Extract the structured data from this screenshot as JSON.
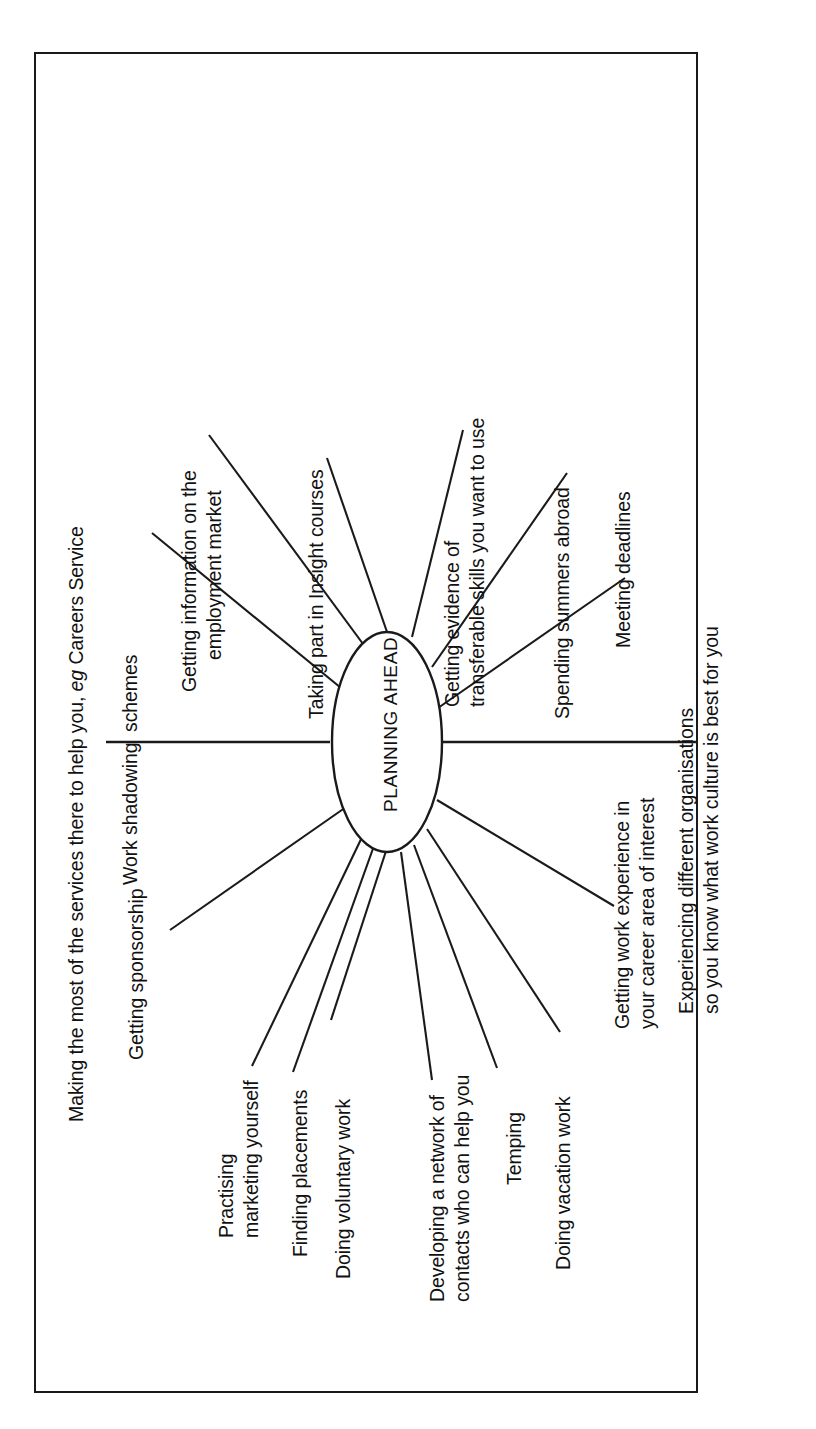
{
  "diagram": {
    "title": "PLANNING AHEAD",
    "orientation": "rotated-90-ccw",
    "center_node": {
      "label": "PLANNING AHEAD",
      "shape": "ellipse"
    },
    "frame": {
      "border_color": "#1a1a1a"
    },
    "branches": [
      {
        "id": "careers-service",
        "label_lines": [
          "Making the most of the services there to help you, ",
          "eg",
          " Careers Service"
        ],
        "label_plain": "Making the most of the services there to help you, eg Careers Service",
        "has_italic_eg": true,
        "connector": "horizontal-line-left"
      },
      {
        "id": "work-shadowing",
        "label_lines": [
          "Work shadowing  schemes"
        ],
        "label_plain": "Work shadowing  schemes",
        "connector": "diagonal-spoke"
      },
      {
        "id": "employment-market",
        "label_lines": [
          "Getting information on the",
          "employment market"
        ],
        "label_plain": "Getting information on the employment market",
        "connector": "diagonal-spoke"
      },
      {
        "id": "insight-courses",
        "label_lines": [
          "Taking part in Insight courses"
        ],
        "label_plain": "Taking part in Insight courses",
        "connector": "diagonal-spoke"
      },
      {
        "id": "transferable-skills",
        "label_lines": [
          "Getting evidence of",
          "transferable skills you want to use"
        ],
        "label_plain": "Getting evidence of transferable skills you want to use",
        "connector": "diagonal-spoke"
      },
      {
        "id": "summers-abroad",
        "label_lines": [
          "Spending summers abroad"
        ],
        "label_plain": "Spending summers abroad",
        "connector": "diagonal-spoke"
      },
      {
        "id": "meeting-deadlines",
        "label_lines": [
          "Meeting deadlines"
        ],
        "label_plain": "Meeting deadlines",
        "connector": "diagonal-spoke"
      },
      {
        "id": "different-organisations",
        "label_lines": [
          "Experiencing different organisations",
          "so you know what work culture is best for you"
        ],
        "label_plain": "Experiencing different organisations so you know what work culture is best for you",
        "connector": "horizontal-line-right"
      },
      {
        "id": "work-experience",
        "label_lines": [
          "Getting work experience in",
          "your career area of interest"
        ],
        "label_plain": "Getting work experience in your career area of interest",
        "connector": "diagonal-spoke"
      },
      {
        "id": "vacation-work",
        "label_lines": [
          "Doing vacation work"
        ],
        "label_plain": "Doing vacation work",
        "connector": "diagonal-spoke"
      },
      {
        "id": "temping",
        "label_lines": [
          "Temping"
        ],
        "label_plain": "Temping",
        "connector": "diagonal-spoke"
      },
      {
        "id": "network-contacts",
        "label_lines": [
          "Developing a network of",
          "contacts who can help you"
        ],
        "label_plain": "Developing a network of contacts who can help you",
        "connector": "diagonal-spoke"
      },
      {
        "id": "voluntary-work",
        "label_lines": [
          "Doing voluntary work"
        ],
        "label_plain": "Doing voluntary work",
        "connector": "diagonal-spoke"
      },
      {
        "id": "finding-placements",
        "label_lines": [
          "Finding placements"
        ],
        "label_plain": "Finding placements",
        "connector": "diagonal-spoke"
      },
      {
        "id": "marketing-yourself",
        "label_lines": [
          "Practising",
          "marketing yourself"
        ],
        "label_plain": "Practising marketing yourself",
        "connector": "diagonal-spoke"
      },
      {
        "id": "sponsorship",
        "label_lines": [
          "Getting sponsorship"
        ],
        "label_plain": "Getting sponsorship",
        "connector": "diagonal-spoke"
      }
    ]
  },
  "labels": {
    "careers_service_a": "Making the most of the services there to help you, ",
    "careers_service_eg": "eg",
    "careers_service_b": " Careers Service",
    "work_shadowing": "Work shadowing  schemes",
    "employment_market_1": "Getting information on the",
    "employment_market_2": "employment market",
    "insight_courses": "Taking part in Insight courses",
    "transferable_1": "Getting evidence of",
    "transferable_2": "transferable skills you want to use",
    "summers_abroad": "Spending summers abroad",
    "meeting_deadlines": "Meeting deadlines",
    "organisations_1": "Experiencing different organisations",
    "organisations_2": "so you know what work culture is best for you",
    "work_experience_1": "Getting work experience in",
    "work_experience_2": "your career area of interest",
    "vacation_work": "Doing vacation work",
    "temping": "Temping",
    "network_1": "Developing a network of",
    "network_2": "contacts who can help you",
    "voluntary_work": "Doing voluntary work",
    "finding_placements": "Finding placements",
    "marketing_1": "Practising",
    "marketing_2": "marketing yourself",
    "sponsorship": "Getting sponsorship",
    "center": "PLANNING AHEAD"
  },
  "colors": {
    "ink": "#1a1a1a",
    "paper": "#ffffff"
  }
}
